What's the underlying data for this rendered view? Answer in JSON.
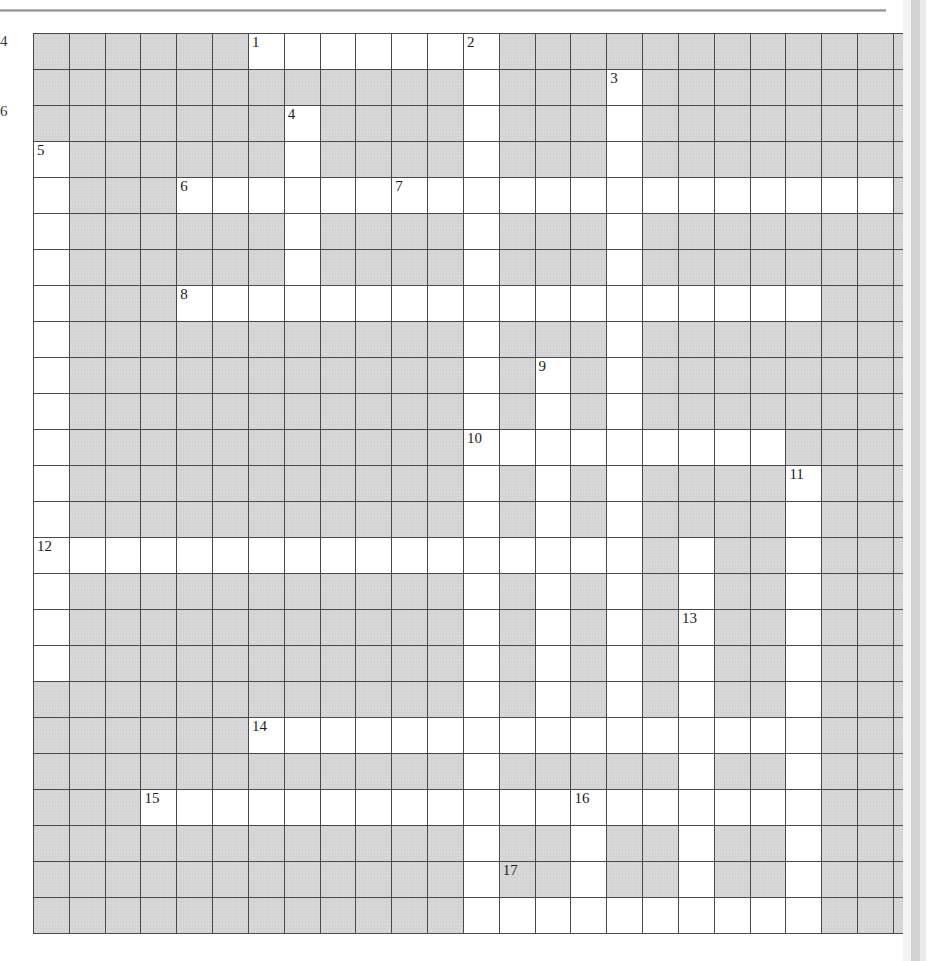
{
  "page": {
    "width": 930,
    "height": 961,
    "background": "#ffffff",
    "rule_color": "#8e8e8e",
    "gutter_color": "#d2d2d2"
  },
  "margin_fragments": [
    {
      "text": "4",
      "top": 34
    },
    {
      "text": "6",
      "top": 104
    }
  ],
  "puzzle": {
    "type": "crossword-grid",
    "title": "Crossword Puzzle Grid",
    "rows": 25,
    "cols": 25,
    "cell_size": 35,
    "origin_x": 33,
    "origin_y": 33,
    "colors": {
      "blocked": "#d3d3d3",
      "open": "#ffffff",
      "border": "#4a4a4a",
      "outer_border": "#2e2e2e",
      "number": "#1c1c1c"
    },
    "clue_count": 17,
    "clue_numbers": [
      {
        "n": "1",
        "row": 0,
        "col": 6
      },
      {
        "n": "2",
        "row": 0,
        "col": 12
      },
      {
        "n": "3",
        "row": 1,
        "col": 16
      },
      {
        "n": "4",
        "row": 2,
        "col": 7
      },
      {
        "n": "5",
        "row": 3,
        "col": 0
      },
      {
        "n": "6",
        "row": 4,
        "col": 4
      },
      {
        "n": "7",
        "row": 4,
        "col": 10
      },
      {
        "n": "8",
        "row": 7,
        "col": 4
      },
      {
        "n": "9",
        "row": 9,
        "col": 14
      },
      {
        "n": "10",
        "row": 11,
        "col": 12
      },
      {
        "n": "11",
        "row": 12,
        "col": 21
      },
      {
        "n": "12",
        "row": 14,
        "col": 0
      },
      {
        "n": "13",
        "row": 16,
        "col": 18
      },
      {
        "n": "14",
        "row": 19,
        "col": 6
      },
      {
        "n": "15",
        "row": 21,
        "col": 3
      },
      {
        "n": "16",
        "row": 21,
        "col": 15
      },
      {
        "n": "17",
        "row": 23,
        "col": 13
      }
    ],
    "open_cells": [
      [
        0,
        6
      ],
      [
        0,
        7
      ],
      [
        0,
        8
      ],
      [
        0,
        9
      ],
      [
        0,
        10
      ],
      [
        0,
        11
      ],
      [
        0,
        12
      ],
      [
        1,
        12
      ],
      [
        1,
        16
      ],
      [
        2,
        7
      ],
      [
        2,
        12
      ],
      [
        2,
        16
      ],
      [
        3,
        0
      ],
      [
        3,
        7
      ],
      [
        3,
        12
      ],
      [
        3,
        16
      ],
      [
        4,
        0
      ],
      [
        4,
        4
      ],
      [
        4,
        5
      ],
      [
        4,
        6
      ],
      [
        4,
        7
      ],
      [
        4,
        8
      ],
      [
        4,
        9
      ],
      [
        4,
        10
      ],
      [
        4,
        11
      ],
      [
        4,
        12
      ],
      [
        4,
        13
      ],
      [
        4,
        14
      ],
      [
        4,
        15
      ],
      [
        4,
        16
      ],
      [
        4,
        17
      ],
      [
        4,
        18
      ],
      [
        4,
        19
      ],
      [
        4,
        20
      ],
      [
        4,
        21
      ],
      [
        4,
        22
      ],
      [
        4,
        23
      ],
      [
        5,
        0
      ],
      [
        5,
        7
      ],
      [
        5,
        12
      ],
      [
        5,
        16
      ],
      [
        6,
        0
      ],
      [
        6,
        7
      ],
      [
        6,
        12
      ],
      [
        6,
        16
      ],
      [
        7,
        0
      ],
      [
        7,
        4
      ],
      [
        7,
        5
      ],
      [
        7,
        6
      ],
      [
        7,
        7
      ],
      [
        7,
        8
      ],
      [
        7,
        9
      ],
      [
        7,
        10
      ],
      [
        7,
        11
      ],
      [
        7,
        12
      ],
      [
        7,
        13
      ],
      [
        7,
        14
      ],
      [
        7,
        15
      ],
      [
        7,
        16
      ],
      [
        7,
        17
      ],
      [
        7,
        18
      ],
      [
        7,
        19
      ],
      [
        7,
        20
      ],
      [
        7,
        21
      ],
      [
        8,
        0
      ],
      [
        8,
        12
      ],
      [
        8,
        16
      ],
      [
        9,
        0
      ],
      [
        9,
        12
      ],
      [
        9,
        14
      ],
      [
        9,
        16
      ],
      [
        10,
        0
      ],
      [
        10,
        12
      ],
      [
        10,
        14
      ],
      [
        10,
        16
      ],
      [
        11,
        0
      ],
      [
        11,
        12
      ],
      [
        11,
        13
      ],
      [
        11,
        14
      ],
      [
        11,
        15
      ],
      [
        11,
        16
      ],
      [
        11,
        17
      ],
      [
        11,
        18
      ],
      [
        11,
        19
      ],
      [
        11,
        20
      ],
      [
        12,
        0
      ],
      [
        12,
        12
      ],
      [
        12,
        14
      ],
      [
        12,
        16
      ],
      [
        12,
        21
      ],
      [
        13,
        0
      ],
      [
        13,
        12
      ],
      [
        13,
        14
      ],
      [
        13,
        16
      ],
      [
        13,
        21
      ],
      [
        14,
        0
      ],
      [
        14,
        1
      ],
      [
        14,
        2
      ],
      [
        14,
        3
      ],
      [
        14,
        4
      ],
      [
        14,
        5
      ],
      [
        14,
        6
      ],
      [
        14,
        7
      ],
      [
        14,
        8
      ],
      [
        14,
        9
      ],
      [
        14,
        10
      ],
      [
        14,
        11
      ],
      [
        14,
        12
      ],
      [
        14,
        13
      ],
      [
        14,
        14
      ],
      [
        14,
        15
      ],
      [
        14,
        16
      ],
      [
        14,
        18
      ],
      [
        14,
        21
      ],
      [
        15,
        0
      ],
      [
        15,
        12
      ],
      [
        15,
        14
      ],
      [
        15,
        16
      ],
      [
        15,
        18
      ],
      [
        15,
        21
      ],
      [
        16,
        0
      ],
      [
        16,
        12
      ],
      [
        16,
        14
      ],
      [
        16,
        16
      ],
      [
        16,
        18
      ],
      [
        16,
        21
      ],
      [
        17,
        0
      ],
      [
        17,
        12
      ],
      [
        17,
        14
      ],
      [
        17,
        16
      ],
      [
        17,
        18
      ],
      [
        17,
        21
      ],
      [
        18,
        12
      ],
      [
        18,
        14
      ],
      [
        18,
        16
      ],
      [
        18,
        18
      ],
      [
        18,
        21
      ],
      [
        19,
        6
      ],
      [
        19,
        7
      ],
      [
        19,
        8
      ],
      [
        19,
        9
      ],
      [
        19,
        10
      ],
      [
        19,
        11
      ],
      [
        19,
        12
      ],
      [
        19,
        13
      ],
      [
        19,
        14
      ],
      [
        19,
        15
      ],
      [
        19,
        16
      ],
      [
        19,
        17
      ],
      [
        19,
        18
      ],
      [
        19,
        19
      ],
      [
        19,
        20
      ],
      [
        19,
        21
      ],
      [
        20,
        12
      ],
      [
        20,
        18
      ],
      [
        20,
        21
      ],
      [
        21,
        3
      ],
      [
        21,
        4
      ],
      [
        21,
        5
      ],
      [
        21,
        6
      ],
      [
        21,
        7
      ],
      [
        21,
        8
      ],
      [
        21,
        9
      ],
      [
        21,
        10
      ],
      [
        21,
        11
      ],
      [
        21,
        12
      ],
      [
        21,
        13
      ],
      [
        21,
        14
      ],
      [
        21,
        15
      ],
      [
        21,
        16
      ],
      [
        21,
        17
      ],
      [
        21,
        18
      ],
      [
        21,
        19
      ],
      [
        21,
        20
      ],
      [
        21,
        21
      ],
      [
        22,
        12
      ],
      [
        22,
        15
      ],
      [
        22,
        18
      ],
      [
        22,
        21
      ],
      [
        23,
        12
      ],
      [
        23,
        15
      ],
      [
        23,
        18
      ],
      [
        23,
        21
      ],
      [
        24,
        12
      ],
      [
        24,
        13
      ],
      [
        24,
        14
      ],
      [
        24,
        15
      ],
      [
        24,
        16
      ],
      [
        24,
        17
      ],
      [
        24,
        18
      ],
      [
        24,
        19
      ],
      [
        24,
        20
      ],
      [
        24,
        21
      ]
    ]
  }
}
